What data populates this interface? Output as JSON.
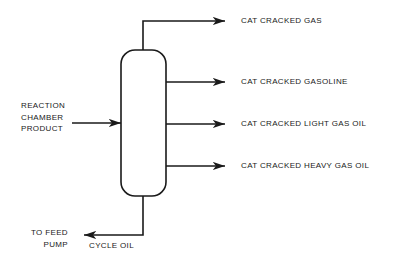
{
  "diagram": {
    "vessel": {
      "name": "fractionator-column",
      "x": 121,
      "y": 50,
      "width": 45,
      "height": 146,
      "corner_radius_top": 14,
      "corner_radius_bottom": 14
    },
    "line_color": "#1a1a1a",
    "line_width": 1.6,
    "background_color": "#ffffff",
    "text_color": "#1a1a1a"
  },
  "inlet": {
    "label_lines": [
      "REACTION",
      "CHAMBER",
      "PRODUCT"
    ],
    "label": "REACTION\nCHAMBER\nPRODUCT",
    "arrow_direction": "right",
    "y": 123
  },
  "outlets": [
    {
      "id": "cat-cracked-gas",
      "label": "CAT CRACKED GAS",
      "y": 21,
      "riser": true,
      "arrow_direction": "right"
    },
    {
      "id": "cat-cracked-gasoline",
      "label": "CAT CRACKED GASOLINE",
      "y": 82,
      "riser": false,
      "arrow_direction": "right"
    },
    {
      "id": "cat-cracked-light-gas-oil",
      "label": "CAT CRACKED LIGHT GAS OIL",
      "y": 124,
      "riser": false,
      "arrow_direction": "right"
    },
    {
      "id": "cat-cracked-heavy-gas-oil",
      "label": "CAT CRACKED HEAVY GAS OIL",
      "y": 166,
      "riser": false,
      "arrow_direction": "right"
    }
  ],
  "bottoms": {
    "stream_label": "CYCLE OIL",
    "destination_lines": [
      "TO FEED",
      "PUMP"
    ],
    "destination_label": "TO FEED\nPUMP",
    "arrow_direction": "left",
    "y": 235
  }
}
